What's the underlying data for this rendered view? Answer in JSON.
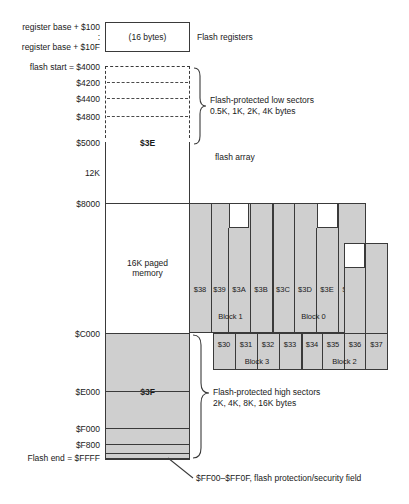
{
  "registers": {
    "addr_top": "register base + $100",
    "addr_mid": ":",
    "addr_bottom": "register base + $10F",
    "box_label": "(16 bytes)",
    "caption": "Flash registers"
  },
  "low_sectors": {
    "addresses": [
      "flash start = $4000",
      "$4200",
      "$4400",
      "$4800",
      "$5000"
    ],
    "page_label": "$3E",
    "caption_line1": "Flash-protected low sectors",
    "caption_line2": "0.5K, 1K, 2K, 4K bytes"
  },
  "array": {
    "caption": "flash array",
    "size_label": "12K",
    "addr_8000": "$8000",
    "paged_line1": "16K paged",
    "paged_line2": "memory",
    "addr_C000": "$C000"
  },
  "high_sectors": {
    "addresses": [
      "$E000",
      "$F000",
      "$F800",
      "Flash end = $FFFF"
    ],
    "page_label": "$3F",
    "caption_line1": "Flash-protected high sectors",
    "caption_line2": "2K, 4K, 8K, 16K bytes"
  },
  "security": {
    "note": "$FF00–$FF0F, flash protection/security field"
  },
  "pages": {
    "upper_row": [
      "$38",
      "$39",
      "$3A",
      "$3B",
      "$3C",
      "$3D",
      "$3E",
      "$3F"
    ],
    "upper_blocks": [
      {
        "label": "Block 1",
        "pages": [
          "$38",
          "$39",
          "$3A",
          "$3B"
        ]
      },
      {
        "label": "Block 0",
        "pages": [
          "$3C",
          "$3D",
          "$3E",
          "$3F"
        ]
      }
    ],
    "lower_row": [
      "$30",
      "$31",
      "$32",
      "$33",
      "$34",
      "$35",
      "$36",
      "$37"
    ],
    "lower_blocks": [
      {
        "label": "Block 3",
        "pages": [
          "$30",
          "$31",
          "$32",
          "$33"
        ]
      },
      {
        "label": "Block 2",
        "pages": [
          "$34",
          "$35",
          "$36",
          "$37"
        ]
      }
    ]
  },
  "colors": {
    "fill_gray": "#cfcfcf",
    "stroke": "#3a3a3a",
    "background": "#ffffff"
  }
}
